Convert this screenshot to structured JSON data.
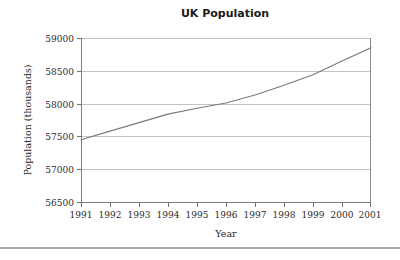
{
  "chart_data": {
    "type": "line",
    "title": "UK Population",
    "xlabel": "Year",
    "ylabel": "Population (thousands)",
    "xlim": [
      1991,
      2001
    ],
    "ylim": [
      56500,
      59000
    ],
    "grid": true,
    "legend": "none",
    "x_ticks": [
      "1991",
      "1992",
      "1993",
      "1994",
      "1995",
      "1996",
      "1997",
      "1998",
      "1999",
      "2000",
      "2001"
    ],
    "y_ticks": [
      "56500",
      "57000",
      "57500",
      "58000",
      "58500",
      "59000"
    ],
    "x": [
      1991,
      1992,
      1993,
      1994,
      1995,
      1996,
      1997,
      1998,
      1999,
      2000,
      2001
    ],
    "series": [
      {
        "name": "UK Population",
        "color": "#7a7a7a",
        "values": [
          57450,
          57580,
          57710,
          57840,
          57930,
          58010,
          58130,
          58280,
          58440,
          58650,
          58850
        ]
      }
    ]
  },
  "figure": {
    "title": "UK Population",
    "x_axis_title": "Year",
    "y_axis_title": "Population (thousands)",
    "x_tick_labels": [
      "1991",
      "1992",
      "1993",
      "1994",
      "1995",
      "1996",
      "1997",
      "1998",
      "1999",
      "2000",
      "2001"
    ],
    "y_tick_labels": [
      "56500",
      "57000",
      "57500",
      "58000",
      "58500",
      "59000"
    ],
    "line_color": "#7a7a7a",
    "grid_color": "#b4b4b4",
    "background_color": "#ffffff"
  }
}
